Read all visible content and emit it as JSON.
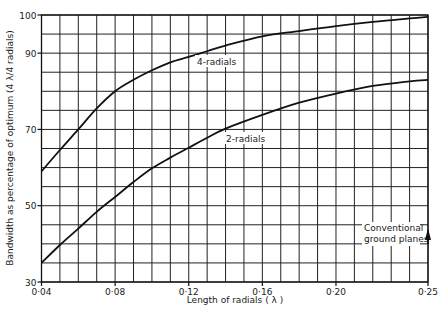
{
  "chart_data": {
    "type": "line",
    "title": "",
    "xlabel": "Length of radials (λ)",
    "ylabel": "Bandwidth as percentage of optimum (4 λ/4 radials)",
    "xlim": [
      0.04,
      0.25
    ],
    "ylim": [
      30,
      100
    ],
    "x_ticks": [
      0.04,
      0.08,
      0.12,
      0.16,
      0.2,
      0.25
    ],
    "x_tick_labels": [
      "0·04",
      "0·08",
      "0·12",
      "0·16",
      "0·20",
      "0·25"
    ],
    "y_ticks": [
      30,
      50,
      70,
      90,
      100
    ],
    "y_tick_labels": [
      "30",
      "50",
      "70",
      "90",
      "100"
    ],
    "grid": true,
    "grid_x_step": 0.01,
    "grid_y_step": 5,
    "legend": "inline labels on curves",
    "series": [
      {
        "name": "4-radials",
        "x": [
          0.04,
          0.05,
          0.06,
          0.07,
          0.08,
          0.09,
          0.1,
          0.11,
          0.12,
          0.13,
          0.14,
          0.16,
          0.18,
          0.2,
          0.22,
          0.24,
          0.25
        ],
        "values": [
          59,
          64.6,
          70,
          75.5,
          80,
          83,
          85.5,
          87.6,
          89,
          90.5,
          92,
          94.4,
          95.8,
          97.1,
          98.2,
          99.1,
          99.5
        ]
      },
      {
        "name": "2-radials",
        "x": [
          0.04,
          0.05,
          0.06,
          0.07,
          0.08,
          0.09,
          0.1,
          0.11,
          0.12,
          0.13,
          0.14,
          0.16,
          0.18,
          0.2,
          0.22,
          0.24,
          0.25
        ],
        "values": [
          35,
          39.7,
          44,
          48.4,
          52.3,
          56.2,
          59.8,
          62.6,
          65.2,
          67.8,
          70.2,
          73.8,
          77,
          79.4,
          81.4,
          82.6,
          83
        ]
      }
    ],
    "annotations": [
      {
        "text": "Conventional",
        "text2": "ground planes",
        "note": "upward arrow at x=0.25, pointing to curve values"
      }
    ]
  },
  "labels": {
    "series_4": "4-radials",
    "series_2": "2-radials",
    "annot_line1": "Conventional",
    "annot_line2": "ground planes",
    "xlabel": "Length of radials  ( λ )",
    "ylabel": "Bandwidth as percentage of optimum (4 λ/4 radials)"
  },
  "colors": {
    "ink": "#111111",
    "grid": "#222222",
    "background": "#ffffff"
  }
}
